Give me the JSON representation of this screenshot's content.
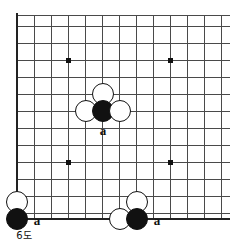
{
  "figure": {
    "caption": "6도",
    "caption_x": 24,
    "caption_y": 236,
    "title": "6도"
  },
  "board": {
    "type": "go-board-diagram",
    "line_color": "#4a4a4a",
    "edge_color": "#222222",
    "stone_black_color": "#111111",
    "stone_white_color": "#ffffff",
    "background_color": "#ffffff",
    "grid_spacing": 17,
    "stone_diameter": 22,
    "vertical_lines_x": [
      17,
      34,
      51,
      68,
      85,
      102,
      119,
      136,
      153,
      170,
      187,
      204,
      221
    ],
    "horizontal_lines_y": [
      15,
      26,
      43,
      60,
      77,
      94,
      111,
      128,
      145,
      162,
      179,
      196,
      213
    ],
    "left_edge_x": 17,
    "bottom_edge_y": 219,
    "grid_right_x": 230,
    "grid_top_y": 15,
    "star_points": [
      {
        "x": 68,
        "y": 60
      },
      {
        "x": 170,
        "y": 60
      },
      {
        "x": 68,
        "y": 162
      },
      {
        "x": 170,
        "y": 162
      }
    ]
  },
  "stones": [
    {
      "color": "white",
      "x": 103,
      "y": 94,
      "name": "white-stone-center-top"
    },
    {
      "color": "white",
      "x": 86,
      "y": 111,
      "name": "white-stone-center-left"
    },
    {
      "color": "black",
      "x": 103,
      "y": 111,
      "name": "black-stone-center"
    },
    {
      "color": "white",
      "x": 120,
      "y": 111,
      "name": "white-stone-center-right"
    },
    {
      "color": "white",
      "x": 17,
      "y": 202,
      "name": "white-stone-bottom-left"
    },
    {
      "color": "black",
      "x": 17,
      "y": 219,
      "name": "black-stone-bottom-left"
    },
    {
      "color": "white",
      "x": 137,
      "y": 202,
      "name": "white-stone-bottom-right-upper"
    },
    {
      "color": "white",
      "x": 120,
      "y": 219,
      "name": "white-stone-bottom-right-left"
    },
    {
      "color": "black",
      "x": 137,
      "y": 219,
      "name": "black-stone-bottom-right"
    }
  ],
  "labels": [
    {
      "text": "a",
      "x": 103,
      "y": 130,
      "name": "point-label-a-center"
    },
    {
      "text": "a",
      "x": 37,
      "y": 220,
      "name": "point-label-a-bottom-left"
    },
    {
      "text": "a",
      "x": 157,
      "y": 220,
      "name": "point-label-a-bottom-right"
    }
  ]
}
